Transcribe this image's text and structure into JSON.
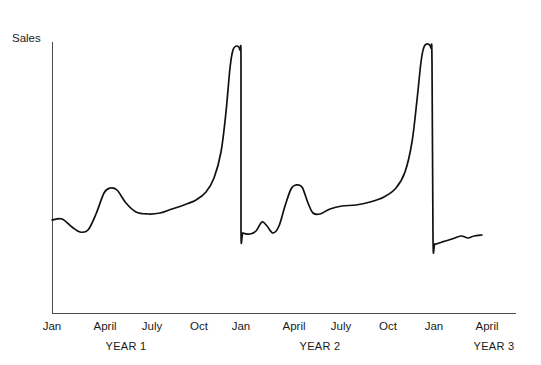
{
  "chart_data": {
    "type": "line",
    "title": "",
    "subtitle": "",
    "xlabel": "",
    "ylabel": "Sales",
    "grid": false,
    "legend": null,
    "axis": {
      "x_start_px": 52,
      "x_end_px": 516,
      "y_top_px": 42,
      "y_bottom_px": 313,
      "y_ticks_shown": false,
      "x_ticks_shown": false
    },
    "tick_labels": [
      {
        "label": "Jan",
        "x": 52
      },
      {
        "label": "April",
        "x": 105
      },
      {
        "label": "July",
        "x": 152
      },
      {
        "label": "Oct",
        "x": 199
      },
      {
        "label": "Jan",
        "x": 241
      },
      {
        "label": "April",
        "x": 294
      },
      {
        "label": "July",
        "x": 341
      },
      {
        "label": "Oct",
        "x": 388
      },
      {
        "label": "Jan",
        "x": 434
      },
      {
        "label": "April",
        "x": 487
      }
    ],
    "period_labels": [
      {
        "label": "YEAR 1",
        "x": 126
      },
      {
        "label": "YEAR 2",
        "x": 320
      },
      {
        "label": "YEAR 3",
        "x": 494
      }
    ],
    "annotations": [],
    "series": [
      {
        "name": "Sales",
        "color": "#111111",
        "description": "Seasonal sales series with two very large December spikes and smaller spring bumps",
        "points": [
          {
            "x": 52,
            "y": 220
          },
          {
            "x": 62,
            "y": 219
          },
          {
            "x": 72,
            "y": 227
          },
          {
            "x": 80,
            "y": 232
          },
          {
            "x": 88,
            "y": 230
          },
          {
            "x": 96,
            "y": 214
          },
          {
            "x": 104,
            "y": 193
          },
          {
            "x": 110,
            "y": 188
          },
          {
            "x": 117,
            "y": 190
          },
          {
            "x": 126,
            "y": 203
          },
          {
            "x": 136,
            "y": 212
          },
          {
            "x": 148,
            "y": 214
          },
          {
            "x": 160,
            "y": 213
          },
          {
            "x": 172,
            "y": 209
          },
          {
            "x": 184,
            "y": 205
          },
          {
            "x": 196,
            "y": 200
          },
          {
            "x": 206,
            "y": 192
          },
          {
            "x": 214,
            "y": 178
          },
          {
            "x": 221,
            "y": 152
          },
          {
            "x": 226,
            "y": 112
          },
          {
            "x": 230,
            "y": 68
          },
          {
            "x": 233,
            "y": 50
          },
          {
            "x": 237,
            "y": 46
          },
          {
            "x": 240,
            "y": 50
          },
          {
            "x": 241,
            "y": 62
          },
          {
            "x": 241,
            "y": 230
          },
          {
            "x": 243,
            "y": 233
          },
          {
            "x": 250,
            "y": 234
          },
          {
            "x": 256,
            "y": 231
          },
          {
            "x": 262,
            "y": 222
          },
          {
            "x": 267,
            "y": 226
          },
          {
            "x": 273,
            "y": 233
          },
          {
            "x": 279,
            "y": 226
          },
          {
            "x": 285,
            "y": 206
          },
          {
            "x": 291,
            "y": 189
          },
          {
            "x": 296,
            "y": 185
          },
          {
            "x": 302,
            "y": 187
          },
          {
            "x": 308,
            "y": 203
          },
          {
            "x": 313,
            "y": 213
          },
          {
            "x": 320,
            "y": 214
          },
          {
            "x": 330,
            "y": 209
          },
          {
            "x": 342,
            "y": 206
          },
          {
            "x": 356,
            "y": 205
          },
          {
            "x": 370,
            "y": 202
          },
          {
            "x": 384,
            "y": 197
          },
          {
            "x": 396,
            "y": 188
          },
          {
            "x": 405,
            "y": 172
          },
          {
            "x": 412,
            "y": 142
          },
          {
            "x": 417,
            "y": 100
          },
          {
            "x": 421,
            "y": 62
          },
          {
            "x": 424,
            "y": 47
          },
          {
            "x": 428,
            "y": 44
          },
          {
            "x": 431,
            "y": 48
          },
          {
            "x": 432,
            "y": 62
          },
          {
            "x": 433,
            "y": 238
          },
          {
            "x": 435,
            "y": 244
          },
          {
            "x": 442,
            "y": 242
          },
          {
            "x": 452,
            "y": 239
          },
          {
            "x": 461,
            "y": 236
          },
          {
            "x": 468,
            "y": 238
          },
          {
            "x": 474,
            "y": 236
          },
          {
            "x": 482,
            "y": 235
          }
        ]
      }
    ]
  }
}
